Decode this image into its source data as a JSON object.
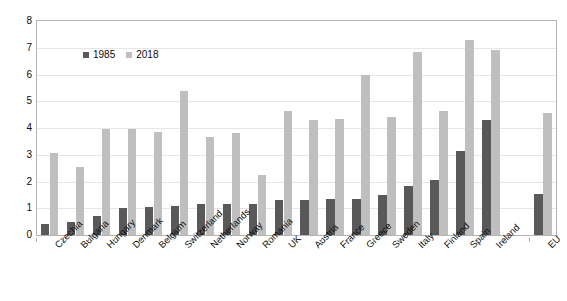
{
  "chart_data": {
    "type": "bar",
    "title": "",
    "subtitle": "",
    "xlabel": "",
    "ylabel": "",
    "ylim": [
      0,
      8
    ],
    "ytick_labels": [
      "0",
      "1",
      "2",
      "3",
      "4",
      "5",
      "6",
      "7",
      "8"
    ],
    "yticks": [
      0,
      1,
      2,
      3,
      4,
      5,
      6,
      7,
      8
    ],
    "grid": true,
    "legend_position": "top-left-inside",
    "categories": [
      "Czechia",
      "Bulgaria",
      "Hungary",
      "Denmark",
      "Belgium",
      "Switzerland",
      "Netherlands",
      "Norway",
      "Romania",
      "UK",
      "Austria",
      "France",
      "Greece",
      "Sweden",
      "Italy",
      "Finland",
      "Spain",
      "Ireland",
      "EU"
    ],
    "separated_category": "EU",
    "series": [
      {
        "name": "1985",
        "color": "#595959",
        "values": [
          0.4,
          0.5,
          0.7,
          1.0,
          1.05,
          1.1,
          1.15,
          1.15,
          1.15,
          1.3,
          1.3,
          1.35,
          1.35,
          1.5,
          1.85,
          2.05,
          3.15,
          4.3,
          1.55
        ]
      },
      {
        "name": "2018",
        "color": "#bfbfbf",
        "values": [
          3.05,
          2.55,
          3.95,
          3.95,
          3.85,
          5.4,
          3.65,
          3.8,
          2.25,
          4.65,
          4.3,
          4.35,
          6.0,
          4.4,
          6.85,
          4.65,
          7.3,
          6.9,
          4.55
        ]
      }
    ]
  },
  "legend": {
    "entries": [
      {
        "label": "1985",
        "color": "#595959"
      },
      {
        "label": "2018",
        "color": "#bfbfbf"
      }
    ]
  },
  "colors": {
    "series_1985": "#595959",
    "series_2018": "#bfbfbf",
    "gridline": "#e6e6e6",
    "axis_border": "#b4b4b4",
    "text": "#0d0d0d",
    "background": "#ffffff"
  }
}
